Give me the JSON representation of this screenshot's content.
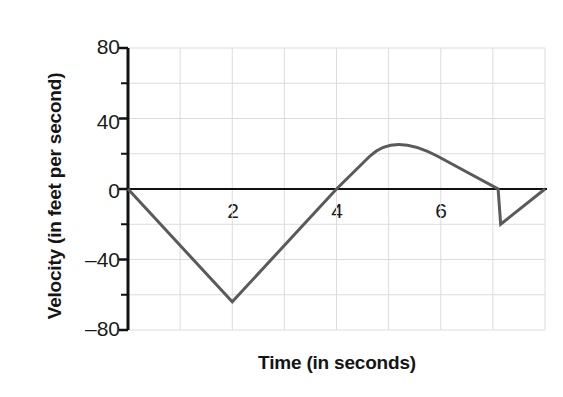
{
  "chart_data": {
    "type": "line",
    "title": "",
    "xlabel": "Time (in seconds)",
    "ylabel": "Velocity (in feet per second)",
    "xlim": [
      0,
      8
    ],
    "ylim": [
      -80,
      80
    ],
    "grid": true,
    "legend": null,
    "x_tick_labels": [
      "2",
      "4",
      "6"
    ],
    "x_tick_values": [
      2,
      4,
      6
    ],
    "y_tick_labels": [
      "80",
      "40",
      "0",
      "‒40",
      "‒80"
    ],
    "y_tick_values": [
      80,
      40,
      0,
      -40,
      -80
    ],
    "y_minor_ticks": [
      60,
      20,
      -20,
      -60
    ],
    "x_gridlines": [
      0,
      1,
      2,
      3,
      4,
      5,
      6,
      7,
      8
    ],
    "y_gridlines": [
      80,
      60,
      40,
      20,
      0,
      -20,
      -40,
      -60,
      -80
    ],
    "series": [
      {
        "name": "velocity",
        "color": "#5a5a5a",
        "line_width": 3,
        "points": [
          {
            "x": 0,
            "y": 0
          },
          {
            "x": 2,
            "y": -64
          },
          {
            "x": 4,
            "y": 0
          },
          {
            "x": 5.1,
            "y": 32
          },
          {
            "x": 7.1,
            "y": 0
          },
          {
            "x": 7.15,
            "y": -20
          },
          {
            "x": 8,
            "y": 0
          }
        ],
        "description": "Piecewise velocity curve: falls linearly to about -64 ft/s at t=2 s, rises linearly through zero at t=4 s to a rounded peak of about 32 ft/s near t=5.1 s, descends through zero near t=7.1 s to about -20 ft/s, then returns to zero at t=8 s."
      }
    ],
    "zero_line": {
      "value": 0,
      "color": "#111111",
      "width": 2
    }
  },
  "axes": {
    "y_axis_color": "#111111",
    "grid_color": "#dcdcdc",
    "background": "#ffffff"
  }
}
